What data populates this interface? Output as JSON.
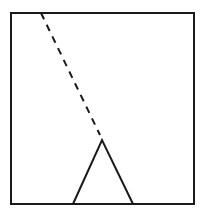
{
  "diagram": {
    "background": "#ffffff",
    "stroke_color": "#1a1a1a",
    "frame": {
      "x": 11,
      "y": 13,
      "width": 183,
      "height": 191,
      "stroke_width": 2
    },
    "dashed_line": {
      "x1": 41,
      "y1": 13,
      "x2": 100,
      "y2": 135,
      "dash": "7,6",
      "stroke_width": 2
    },
    "triangle": {
      "points": "73,204 102,140 133,204",
      "stroke_width": 2
    }
  }
}
